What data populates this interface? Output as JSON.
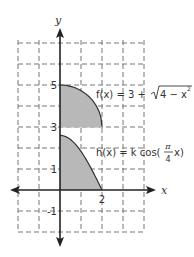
{
  "chart_data": {
    "type": "area",
    "title": "",
    "xlabel": "x",
    "ylabel": "y",
    "xlim": [
      -2,
      4
    ],
    "ylim": [
      -2,
      7
    ],
    "grid": "dashed",
    "tick_labels": {
      "x": [
        {
          "value": 2,
          "label": "2"
        }
      ],
      "y": [
        {
          "value": 5,
          "label": "5"
        },
        {
          "value": 3,
          "label": "3"
        },
        {
          "value": 1,
          "label": "1"
        },
        {
          "value": -1,
          "label": "-1"
        }
      ]
    },
    "series": [
      {
        "name": "f(x) = 3 + √(4 − x²)",
        "label_parts": {
          "lhs": "f(x) = 3 + ",
          "radicand": "4 − x",
          "exp": "2"
        },
        "domain": [
          0,
          2
        ],
        "baseline": 3,
        "shaded": true,
        "x": [
          0,
          0.5,
          1,
          1.5,
          1.8,
          2
        ],
        "values": [
          5,
          4.94,
          4.73,
          4.32,
          3.87,
          3
        ]
      },
      {
        "name": "h(x) = k cos(π/4 x)",
        "label_parts": {
          "lhs": "h(x) = k cos(",
          "num": "π",
          "den": "4",
          "rhs": "x)"
        },
        "domain": [
          0,
          2
        ],
        "baseline": 0,
        "shaded": true,
        "x": [
          0,
          0.5,
          1,
          1.5,
          2
        ],
        "values": [
          2.6,
          2.4,
          1.84,
          1.0,
          0
        ]
      }
    ],
    "colors": {
      "fill": "#b8b8b8",
      "curve": "#333333",
      "axis": "#222222",
      "grid": "#777777"
    }
  }
}
